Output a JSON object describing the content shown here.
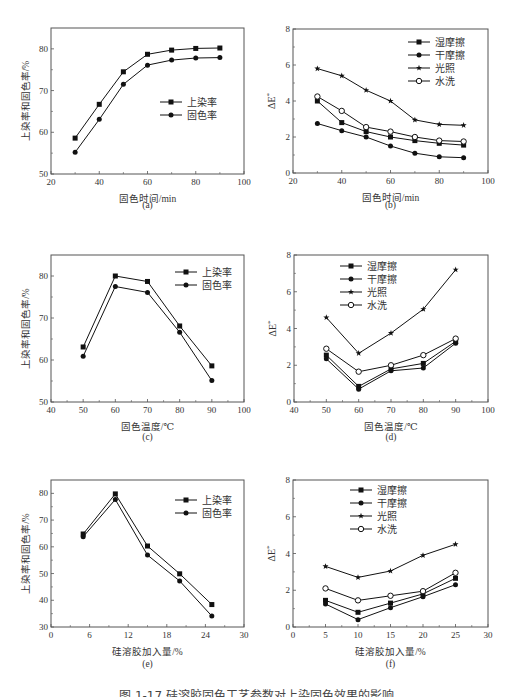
{
  "figure_caption": "图 1-17  硅溶胶固色工艺参数对上染固色效果的影响",
  "colors": {
    "line": "#111111",
    "axis": "#555555",
    "text": "#333333"
  },
  "chart_data": [
    {
      "id": "a",
      "panel_label": "(a)",
      "type": "line",
      "title": "",
      "xlabel": "固色时间/min",
      "ylabel": "上染率和固色率/%",
      "xlim": [
        20,
        100
      ],
      "ylim": [
        50,
        85
      ],
      "xticks": [
        20,
        40,
        60,
        80,
        100
      ],
      "yticks": [
        50,
        60,
        70,
        80
      ],
      "grid": false,
      "legend_position": "center-right",
      "x": [
        30,
        40,
        50,
        60,
        70,
        80,
        90
      ],
      "series": [
        {
          "name": "上染率",
          "marker": "square",
          "values": [
            58.6,
            66.7,
            74.5,
            78.7,
            79.7,
            80.1,
            80.2
          ]
        },
        {
          "name": "固色率",
          "marker": "circle",
          "values": [
            55.2,
            63.1,
            71.5,
            76.1,
            77.3,
            77.8,
            77.9
          ]
        }
      ]
    },
    {
      "id": "b",
      "panel_label": "(b)",
      "type": "line",
      "title": "",
      "xlabel": "固色时间/min",
      "ylabel": "ΔE*",
      "xlim": [
        20,
        100
      ],
      "ylim": [
        0,
        8
      ],
      "xticks": [
        20,
        40,
        60,
        80,
        100
      ],
      "yticks": [
        0,
        2,
        4,
        6,
        8
      ],
      "grid": false,
      "legend_position": "upper-right",
      "x": [
        30,
        40,
        50,
        60,
        70,
        80,
        90
      ],
      "series": [
        {
          "name": "湿摩擦",
          "marker": "square",
          "values": [
            4.0,
            2.8,
            2.3,
            2.0,
            1.8,
            1.65,
            1.55
          ]
        },
        {
          "name": "干摩擦",
          "marker": "circle",
          "values": [
            2.75,
            2.35,
            2.0,
            1.5,
            1.1,
            0.9,
            0.85
          ]
        },
        {
          "name": "光照",
          "marker": "star",
          "values": [
            5.8,
            5.4,
            4.6,
            4.0,
            2.95,
            2.7,
            2.65
          ]
        },
        {
          "name": "水洗",
          "marker": "open-circle",
          "values": [
            4.25,
            3.45,
            2.55,
            2.3,
            2.0,
            1.8,
            1.75
          ]
        }
      ]
    },
    {
      "id": "c",
      "panel_label": "(c)",
      "type": "line",
      "title": "",
      "xlabel": "固色温度/℃",
      "ylabel": "上染率和固色率/%",
      "xlim": [
        40,
        100
      ],
      "ylim": [
        50,
        85
      ],
      "xticks": [
        40,
        50,
        60,
        70,
        80,
        90,
        100
      ],
      "yticks": [
        50,
        60,
        70,
        80
      ],
      "grid": false,
      "legend_position": "upper-right",
      "x": [
        50,
        60,
        70,
        80,
        90
      ],
      "series": [
        {
          "name": "上染率",
          "marker": "square",
          "values": [
            63.1,
            80.0,
            78.7,
            68.1,
            58.6
          ]
        },
        {
          "name": "固色率",
          "marker": "circle",
          "values": [
            60.9,
            77.5,
            76.1,
            66.6,
            55.1
          ]
        }
      ]
    },
    {
      "id": "d",
      "panel_label": "(d)",
      "type": "line",
      "title": "",
      "xlabel": "固色温度/℃",
      "ylabel": "ΔE*",
      "xlim": [
        40,
        100
      ],
      "ylim": [
        0,
        8
      ],
      "xticks": [
        40,
        50,
        60,
        70,
        80,
        90,
        100
      ],
      "yticks": [
        0,
        2,
        4,
        6,
        8
      ],
      "grid": false,
      "legend_position": "upper-left",
      "x": [
        50,
        60,
        70,
        80,
        90
      ],
      "series": [
        {
          "name": "湿摩擦",
          "marker": "square",
          "values": [
            2.55,
            0.85,
            1.8,
            2.1,
            3.3
          ]
        },
        {
          "name": "干摩擦",
          "marker": "circle",
          "values": [
            2.35,
            0.7,
            1.7,
            1.85,
            3.2
          ]
        },
        {
          "name": "光照",
          "marker": "star",
          "values": [
            4.6,
            2.65,
            3.75,
            5.05,
            7.2
          ]
        },
        {
          "name": "水洗",
          "marker": "open-circle",
          "values": [
            2.9,
            1.65,
            2.0,
            2.55,
            3.45
          ]
        }
      ]
    },
    {
      "id": "e",
      "panel_label": "(e)",
      "type": "line",
      "title": "",
      "xlabel": "硅溶胶加入量/%",
      "ylabel": "上染率和固色率/%",
      "xlim": [
        0,
        30
      ],
      "ylim": [
        30,
        85
      ],
      "xticks": [
        0,
        6,
        12,
        18,
        24,
        30
      ],
      "yticks": [
        30,
        40,
        50,
        60,
        70,
        80
      ],
      "grid": false,
      "legend_position": "upper-right",
      "x": [
        5,
        10,
        15,
        20,
        25
      ],
      "series": [
        {
          "name": "上染率",
          "marker": "square",
          "values": [
            64.8,
            79.8,
            60.3,
            49.9,
            38.4
          ]
        },
        {
          "name": "固色率",
          "marker": "circle",
          "values": [
            63.8,
            77.7,
            56.9,
            47.2,
            34.1
          ]
        }
      ]
    },
    {
      "id": "f",
      "panel_label": "(f)",
      "type": "line",
      "title": "",
      "xlabel": "硅溶胶加入量/%",
      "ylabel": "ΔE*",
      "xlim": [
        0,
        30
      ],
      "ylim": [
        0,
        8
      ],
      "xticks": [
        0,
        5,
        10,
        15,
        20,
        25,
        30
      ],
      "yticks": [
        0,
        2,
        4,
        6,
        8
      ],
      "grid": false,
      "legend_position": "upper-left",
      "x": [
        5,
        10,
        15,
        20,
        25
      ],
      "series": [
        {
          "name": "湿摩擦",
          "marker": "square",
          "values": [
            1.45,
            0.8,
            1.3,
            1.8,
            2.65
          ]
        },
        {
          "name": "干摩擦",
          "marker": "circle",
          "values": [
            1.25,
            0.4,
            1.05,
            1.65,
            2.3
          ]
        },
        {
          "name": "光照",
          "marker": "star",
          "values": [
            3.3,
            2.7,
            3.05,
            3.9,
            4.5
          ]
        },
        {
          "name": "水洗",
          "marker": "open-circle",
          "values": [
            2.1,
            1.45,
            1.7,
            1.95,
            2.95
          ]
        }
      ]
    }
  ],
  "layout": [
    {
      "id": "a",
      "frame": [
        51,
        28,
        244,
        174
      ],
      "legend": [
        160,
        102
      ],
      "caption_y": 208
    },
    {
      "id": "b",
      "frame": [
        293,
        29,
        488,
        173
      ],
      "legend": [
        408,
        42
      ],
      "caption_y": 208
    },
    {
      "id": "c",
      "frame": [
        51,
        255,
        244,
        402
      ],
      "legend": [
        175,
        272
      ],
      "caption_y": 440
    },
    {
      "id": "d",
      "frame": [
        294,
        255,
        488,
        402
      ],
      "legend": [
        340,
        266
      ],
      "caption_y": 440
    },
    {
      "id": "e",
      "frame": [
        51,
        480,
        244,
        627
      ],
      "legend": [
        175,
        500
      ],
      "caption_y": 667
    },
    {
      "id": "f",
      "frame": [
        293,
        480,
        488,
        627
      ],
      "legend": [
        350,
        490
      ],
      "caption_y": 667
    }
  ]
}
